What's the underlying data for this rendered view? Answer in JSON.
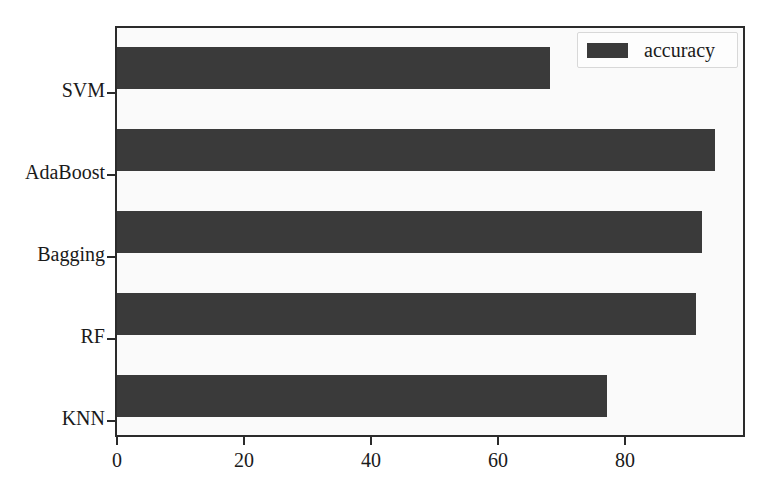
{
  "chart_data": {
    "type": "bar",
    "orientation": "horizontal",
    "title": "",
    "xlabel": "",
    "ylabel": "",
    "categories": [
      "KNN",
      "RF",
      "Bagging",
      "AdaBoost",
      "SVM"
    ],
    "values": [
      77,
      91,
      92,
      94,
      68
    ],
    "series": [
      {
        "name": "accuracy",
        "values": [
          77,
          91,
          92,
          94,
          68
        ],
        "color": "#3a3a3a"
      }
    ],
    "xlim": [
      0,
      99
    ],
    "xticks": [
      0,
      20,
      40,
      60,
      80
    ],
    "xtick_labels": [
      "0",
      "20",
      "40",
      "60",
      "80"
    ],
    "ytick_labels": [
      "KNN",
      "RF",
      "Bagging",
      "AdaBoost",
      "SVM"
    ],
    "grid": false,
    "legend": {
      "entries": [
        {
          "label": "accuracy",
          "color": "#3a3a3a"
        }
      ],
      "position": "upper right"
    },
    "colors": {
      "bar": "#3a3a3a",
      "plot_background": "#fafafa",
      "figure_background": "#ffffff",
      "axis": "#2b2b2b",
      "text": "#1a1a1a"
    }
  },
  "bars": [
    {
      "label": "SVM",
      "value": 68,
      "top": 19,
      "index": 0
    },
    {
      "label": "AdaBoost",
      "value": 94,
      "top": 101,
      "index": 1
    },
    {
      "label": "Bagging",
      "value": 92,
      "top": 183,
      "index": 2
    },
    {
      "label": "RF",
      "value": 91,
      "top": 265,
      "index": 3
    },
    {
      "label": "KNN",
      "value": 77,
      "top": 347,
      "index": 4
    }
  ],
  "yticks": [
    {
      "label": "SVM",
      "center": 66
    },
    {
      "label": "AdaBoost",
      "center": 148
    },
    {
      "label": "Bagging",
      "center": 230
    },
    {
      "label": "RF",
      "center": 312
    },
    {
      "label": "KNN",
      "center": 394
    }
  ],
  "xticks": [
    {
      "label": "0",
      "x": 116
    },
    {
      "label": "20",
      "x": 243
    },
    {
      "label": "40",
      "x": 370
    },
    {
      "label": "60",
      "x": 497
    },
    {
      "label": "80",
      "x": 624
    }
  ],
  "legend": {
    "label": "accuracy",
    "swatch_color": "#3a3a3a"
  }
}
